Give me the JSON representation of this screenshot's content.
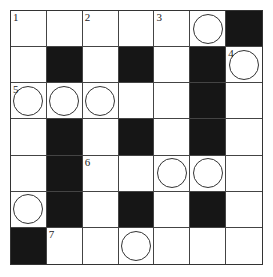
{
  "puzzle": {
    "rows": 7,
    "cols": 7,
    "cells": [
      [
        {
          "t": "w",
          "n": "1"
        },
        {
          "t": "w"
        },
        {
          "t": "w",
          "n": "2"
        },
        {
          "t": "w"
        },
        {
          "t": "w",
          "n": "3"
        },
        {
          "t": "w",
          "c": true
        },
        {
          "t": "b"
        }
      ],
      [
        {
          "t": "w"
        },
        {
          "t": "b"
        },
        {
          "t": "w"
        },
        {
          "t": "b"
        },
        {
          "t": "w"
        },
        {
          "t": "b"
        },
        {
          "t": "w",
          "n": "4",
          "c": true
        }
      ],
      [
        {
          "t": "w",
          "n": "5",
          "c": true
        },
        {
          "t": "w",
          "c": true
        },
        {
          "t": "w",
          "c": true
        },
        {
          "t": "w"
        },
        {
          "t": "w"
        },
        {
          "t": "b"
        },
        {
          "t": "w"
        }
      ],
      [
        {
          "t": "w"
        },
        {
          "t": "b"
        },
        {
          "t": "w"
        },
        {
          "t": "b"
        },
        {
          "t": "w"
        },
        {
          "t": "b"
        },
        {
          "t": "w"
        }
      ],
      [
        {
          "t": "w"
        },
        {
          "t": "b"
        },
        {
          "t": "w",
          "n": "6"
        },
        {
          "t": "w"
        },
        {
          "t": "w",
          "c": true
        },
        {
          "t": "w",
          "c": true
        },
        {
          "t": "w"
        }
      ],
      [
        {
          "t": "w",
          "c": true
        },
        {
          "t": "b"
        },
        {
          "t": "w"
        },
        {
          "t": "b"
        },
        {
          "t": "w"
        },
        {
          "t": "b"
        },
        {
          "t": "w"
        }
      ],
      [
        {
          "t": "b"
        },
        {
          "t": "w",
          "n": "7"
        },
        {
          "t": "w"
        },
        {
          "t": "w",
          "c": true
        },
        {
          "t": "w"
        },
        {
          "t": "w"
        },
        {
          "t": "w"
        }
      ]
    ]
  }
}
